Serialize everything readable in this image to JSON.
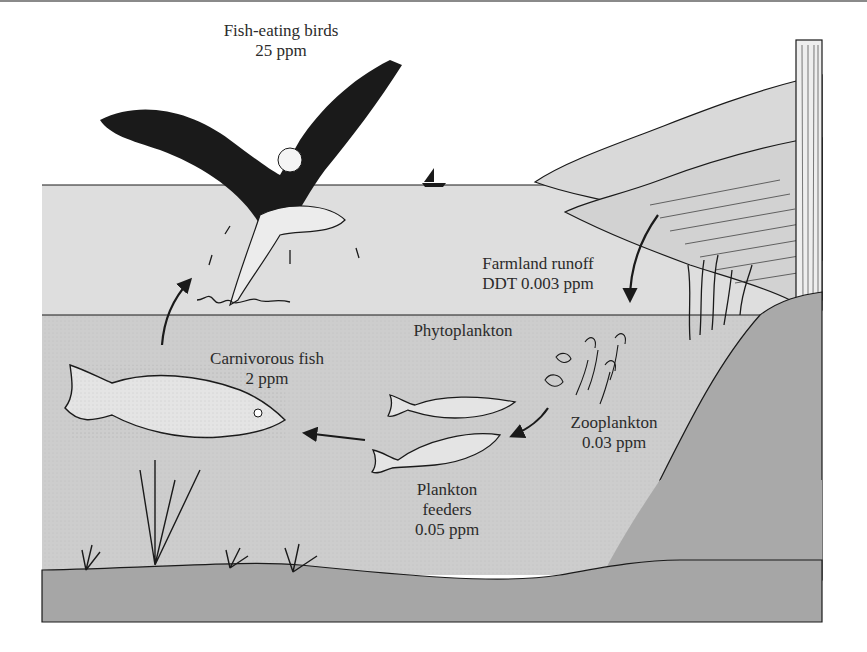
{
  "diagram": {
    "topic": "DDT biomagnification in a food chain",
    "labels": {
      "birds": {
        "name": "Fish-eating birds",
        "value": "25 ppm"
      },
      "runoff": {
        "name": "Farmland runoff",
        "value": "DDT 0.003 ppm"
      },
      "phytoplankton": {
        "name": "Phytoplankton"
      },
      "carnivorous_fish": {
        "name": "Carnivorous fish",
        "value": "2 ppm"
      },
      "zooplankton": {
        "name": "Zooplankton",
        "value": "0.03 ppm"
      },
      "plankton_feeders": {
        "name_line1": "Plankton",
        "name_line2": "feeders",
        "value": "0.05 ppm"
      }
    },
    "colors": {
      "sky": "#ffffff",
      "surface_water": "#dedede",
      "deep_water": "#cdcdcd",
      "hill": "#d6d6d6",
      "bank": "#a9a9a9",
      "lake_bed": "#a6a6a6",
      "ink": "#1a1a1a",
      "text": "#2b2b2b"
    },
    "flow_arrows": [
      "runoff-to-phytoplankton",
      "zooplankton-to-plankton-feeders",
      "plankton-feeders-to-carnivorous-fish",
      "carnivorous-fish-to-birds"
    ]
  }
}
